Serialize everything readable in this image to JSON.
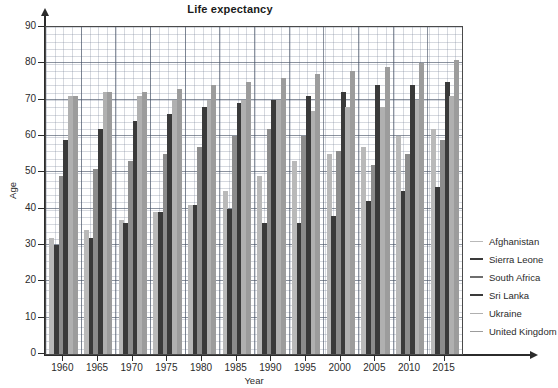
{
  "chart_data": {
    "type": "bar",
    "title": "Life expectancy",
    "xlabel": "Year",
    "ylabel": "Age",
    "ylim": [
      0,
      90
    ],
    "ytick_labels": [
      "0",
      "10",
      "20",
      "30",
      "40",
      "50",
      "60",
      "70",
      "80",
      "90"
    ],
    "ytick_values": [
      0,
      10,
      20,
      30,
      40,
      50,
      60,
      70,
      80,
      90
    ],
    "grid": true,
    "legend_position": "right",
    "categories": [
      "1960",
      "1965",
      "1970",
      "1975",
      "1980",
      "1985",
      "1990",
      "1995",
      "2000",
      "2005",
      "2010",
      "2015"
    ],
    "series": [
      {
        "name": "Afghanistan",
        "color": "#b9b9b9",
        "values": [
          32,
          34,
          37,
          39,
          41,
          45,
          49,
          53,
          55,
          57,
          60,
          62
        ]
      },
      {
        "name": "Sierra Leone",
        "color": "#3a3a3a",
        "values": [
          30,
          32,
          36,
          39,
          41,
          40,
          36,
          36,
          38,
          42,
          45,
          46
        ]
      },
      {
        "name": "South Africa",
        "color": "#8c8c8c",
        "values": [
          49,
          51,
          53,
          55,
          57,
          60,
          62,
          60,
          56,
          52,
          55,
          59
        ]
      },
      {
        "name": "Sri Lanka",
        "color": "#3a3a3a",
        "values": [
          59,
          62,
          64,
          66,
          68,
          69,
          70,
          71,
          72,
          74,
          74,
          75
        ]
      },
      {
        "name": "Ukraine",
        "color": "#b0b0b0",
        "values": [
          71,
          72,
          71,
          70,
          70,
          70,
          70,
          67,
          68,
          68,
          70,
          71
        ]
      },
      {
        "name": "United Kingdom",
        "color": "#9c9c9c",
        "values": [
          71,
          72,
          72,
          73,
          74,
          75,
          76,
          77,
          78,
          79,
          80,
          81
        ]
      }
    ]
  },
  "legend": {
    "items": [
      {
        "label": "Afghanistan",
        "color": "#b9b9b9",
        "weight": 1.5
      },
      {
        "label": "Sierra Leone",
        "color": "#3a3a3a",
        "weight": 2.2
      },
      {
        "label": "South Africa",
        "color": "#6e6e6e",
        "weight": 2.0
      },
      {
        "label": "Sri Lanka",
        "color": "#3a3a3a",
        "weight": 2.2
      },
      {
        "label": "Ukraine",
        "color": "#b0b0b0",
        "weight": 1.5
      },
      {
        "label": "United Kingdom",
        "color": "#9c9c9c",
        "weight": 1.6
      }
    ]
  }
}
